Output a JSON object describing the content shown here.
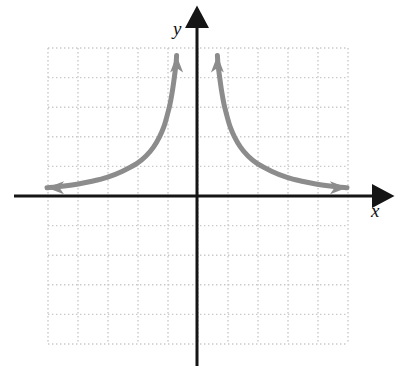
{
  "figure": {
    "kind": "cartesian-graph",
    "background_color": "#ffffff",
    "width": 403,
    "height": 376
  },
  "axes": {
    "x_label": "x",
    "y_label": "y",
    "axis_color": "#151515",
    "axis_width": 3,
    "origin_px": [
      197,
      196
    ],
    "x_axis_tip_px": [
      383,
      196
    ],
    "y_axis_tip_px": [
      197,
      17
    ],
    "x_axis_start_px": [
      14,
      196
    ],
    "y_axis_end_px": [
      197,
      366
    ]
  },
  "grid": {
    "color": "#c9c9c9",
    "style": "dotted",
    "cols": 10,
    "rows": 10,
    "cell_px": 30,
    "left_px": 48,
    "top_px": 48,
    "right_px": 348,
    "bottom_px": 344
  },
  "chart_data": {
    "type": "line",
    "title": "",
    "xlabel": "x",
    "ylabel": "y",
    "grid": true,
    "legend": null,
    "xlim": [
      -5,
      5
    ],
    "ylim": [
      -5,
      5
    ],
    "xticks": [
      -5,
      -4,
      -3,
      -2,
      -1,
      0,
      1,
      2,
      3,
      4,
      5
    ],
    "yticks": [
      -5,
      -4,
      -3,
      -2,
      -1,
      0,
      1,
      2,
      3,
      4,
      5
    ],
    "tick_labels_shown": false,
    "curve_color": "#8c8c8c",
    "curve_width": 5,
    "asymptotes": {
      "vertical": [
        0
      ],
      "horizontal": [
        0
      ]
    },
    "arrowheads": [
      {
        "at": [
          -5.0,
          0.28
        ],
        "direction": "left"
      },
      {
        "at": [
          -0.68,
          4.75
        ],
        "direction": "up"
      },
      {
        "at": [
          0.68,
          4.75
        ],
        "direction": "up"
      },
      {
        "at": [
          5.0,
          0.28
        ],
        "direction": "right"
      }
    ],
    "series": [
      {
        "name": "left-branch",
        "points": [
          [
            -5.0,
            0.28
          ],
          [
            -4.5,
            0.33
          ],
          [
            -4.0,
            0.4
          ],
          [
            -3.5,
            0.5
          ],
          [
            -3.0,
            0.63
          ],
          [
            -2.5,
            0.83
          ],
          [
            -2.0,
            1.1
          ],
          [
            -1.7,
            1.35
          ],
          [
            -1.45,
            1.65
          ],
          [
            -1.25,
            2.0
          ],
          [
            -1.1,
            2.35
          ],
          [
            -1.0,
            2.7
          ],
          [
            -0.9,
            3.1
          ],
          [
            -0.82,
            3.55
          ],
          [
            -0.75,
            4.05
          ],
          [
            -0.7,
            4.45
          ],
          [
            -0.68,
            4.75
          ]
        ]
      },
      {
        "name": "right-branch",
        "points": [
          [
            0.68,
            4.75
          ],
          [
            0.7,
            4.45
          ],
          [
            0.75,
            4.05
          ],
          [
            0.82,
            3.55
          ],
          [
            0.9,
            3.1
          ],
          [
            1.0,
            2.7
          ],
          [
            1.1,
            2.35
          ],
          [
            1.25,
            2.0
          ],
          [
            1.45,
            1.65
          ],
          [
            1.7,
            1.35
          ],
          [
            2.0,
            1.1
          ],
          [
            2.5,
            0.83
          ],
          [
            3.0,
            0.63
          ],
          [
            3.5,
            0.5
          ],
          [
            4.0,
            0.4
          ],
          [
            4.5,
            0.33
          ],
          [
            5.0,
            0.28
          ]
        ]
      }
    ]
  }
}
